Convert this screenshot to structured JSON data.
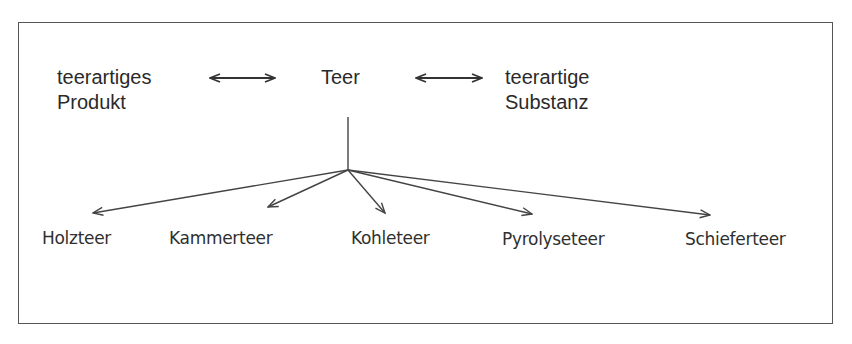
{
  "diagram": {
    "type": "tree",
    "top_row": {
      "left": {
        "line1": "teerartiges",
        "line2": "Produkt"
      },
      "center": "Teer",
      "right": {
        "line1": "teerartige",
        "line2": "Substanz"
      },
      "relation": "bidirectional-equivalence"
    },
    "children": [
      {
        "label": "Holzteer"
      },
      {
        "label": "Kammerteer"
      },
      {
        "label": "Kohleteer"
      },
      {
        "label": "Pyrolyseteer"
      },
      {
        "label": "Schieferteer"
      }
    ],
    "colors": {
      "line": "#444444",
      "text": "#2a2a2a",
      "border": "#555555"
    }
  }
}
